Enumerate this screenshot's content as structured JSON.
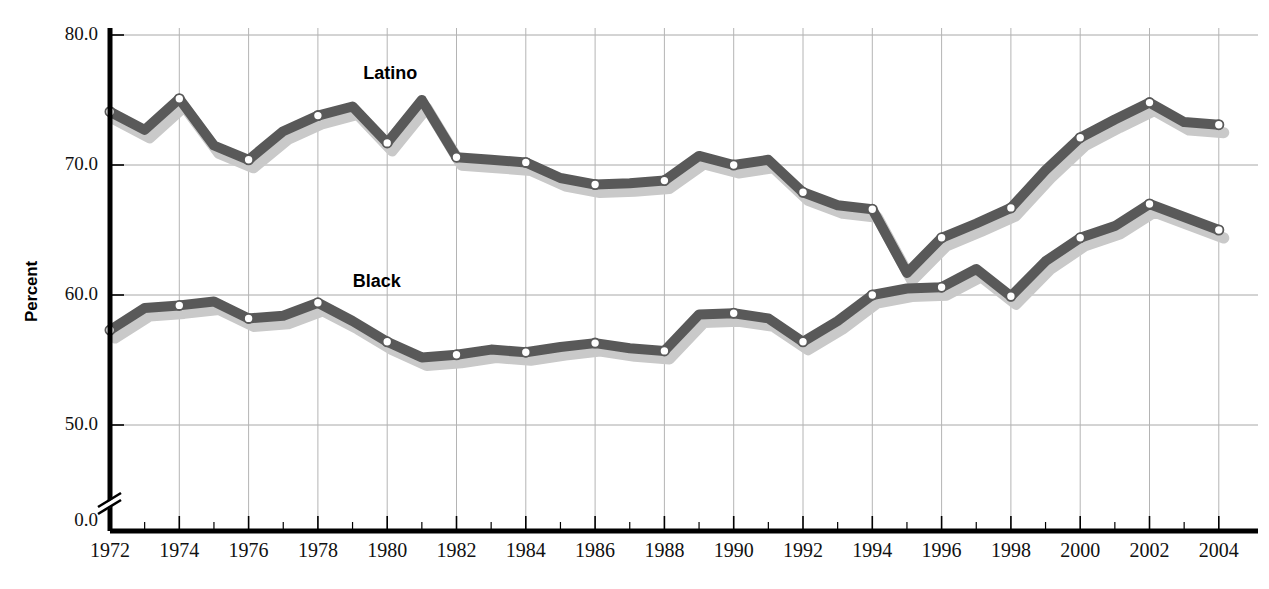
{
  "chart_data": {
    "type": "line",
    "title": "",
    "xlabel": "",
    "ylabel": "Percent",
    "xlim": [
      1972,
      2004
    ],
    "ylim": [
      45.5,
      81.0
    ],
    "yticks": [
      0.0,
      50.0,
      60.0,
      70.0,
      80.0
    ],
    "ytick_labels": [
      "0.0",
      "50.0",
      "60.0",
      "70.0",
      "80.0"
    ],
    "axis_break": true,
    "grid": true,
    "grid_major_years": [
      1972,
      1974,
      1976,
      1978,
      1980,
      1982,
      1984,
      1986,
      1988,
      1990,
      1992,
      1994,
      1996,
      1998,
      2000,
      2002,
      2004
    ],
    "legend_position": "inline-annotation",
    "x": [
      1972,
      1973,
      1974,
      1975,
      1976,
      1977,
      1978,
      1979,
      1980,
      1981,
      1982,
      1983,
      1984,
      1985,
      1986,
      1987,
      1988,
      1989,
      1990,
      1991,
      1992,
      1993,
      1994,
      1995,
      1996,
      1997,
      1998,
      1999,
      2000,
      2001,
      2002,
      2003,
      2004
    ],
    "xtick_labels": [
      "1972",
      "1974",
      "1976",
      "1978",
      "1980",
      "1982",
      "1984",
      "1986",
      "1988",
      "1990",
      "1992",
      "1994",
      "1996",
      "1998",
      "2000",
      "2002",
      "2004"
    ],
    "series": [
      {
        "name": "Latino",
        "label": "Latino",
        "color": "#595959",
        "shadow_color": "#c9c9c9",
        "marker_years": [
          1972,
          1974,
          1976,
          1978,
          1980,
          1982,
          1984,
          1986,
          1988,
          1990,
          1992,
          1994,
          1996,
          1998,
          2000,
          2002,
          2004
        ],
        "values": [
          74.1,
          72.7,
          75.1,
          71.5,
          70.4,
          72.6,
          73.8,
          74.5,
          71.7,
          75.0,
          70.6,
          70.4,
          70.2,
          69.0,
          68.5,
          68.6,
          68.8,
          70.7,
          70.0,
          70.4,
          67.9,
          66.9,
          66.6,
          61.7,
          64.4,
          65.5,
          66.7,
          69.6,
          72.1,
          73.5,
          74.8,
          73.3,
          73.1
        ]
      },
      {
        "name": "Black",
        "label": "Black",
        "color": "#595959",
        "shadow_color": "#c9c9c9",
        "marker_years": [
          1972,
          1974,
          1976,
          1978,
          1980,
          1982,
          1984,
          1986,
          1988,
          1990,
          1992,
          1994,
          1996,
          1998,
          2000,
          2002,
          2004
        ],
        "values": [
          57.3,
          59.0,
          59.2,
          59.5,
          58.2,
          58.4,
          59.4,
          58.0,
          56.4,
          55.2,
          55.4,
          55.8,
          55.6,
          56.0,
          56.3,
          55.9,
          55.7,
          58.5,
          58.6,
          58.2,
          56.4,
          58.0,
          60.0,
          60.5,
          60.6,
          62.0,
          59.9,
          62.6,
          64.4,
          65.3,
          67.0,
          66.0,
          65.0
        ]
      }
    ],
    "annotations": [
      {
        "text": "Latino",
        "x": 1980.0,
        "y": 77.0
      },
      {
        "text": "Black",
        "x": 1979.7,
        "y": 61.0
      }
    ]
  },
  "axis": {
    "y_axis_label": "Percent",
    "zero_label": "0.0"
  }
}
